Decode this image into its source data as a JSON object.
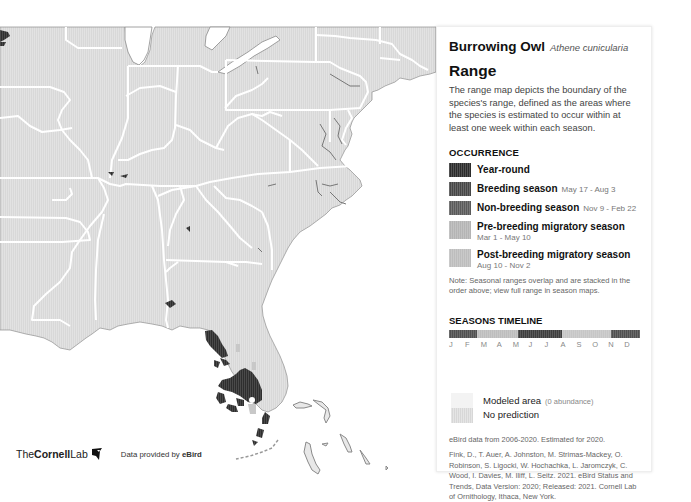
{
  "species": {
    "common_name": "Burrowing Owl",
    "scientific_name": "Athene cunicularia"
  },
  "panel": {
    "heading": "Range",
    "description": "The range map depicts the boundary of the species's range, defined as the areas where the species is estimated to occur within at least one week within each season.",
    "occurrence_heading": "OCCURRENCE",
    "legend": [
      {
        "label": "Year-round",
        "dates": "",
        "color": "#2b2b2b"
      },
      {
        "label": "Breeding season",
        "dates": "May 17 - Aug 3",
        "color": "#474747"
      },
      {
        "label": "Non-breeding season",
        "dates": "Nov 9 - Feb 22",
        "color": "#5a5a5a"
      },
      {
        "label": "Pre-breeding migratory season",
        "dates": "Mar 1 - May 10",
        "color": "#b4b4b4"
      },
      {
        "label": "Post-breeding migratory season",
        "dates": "Aug 10 - Nov 2",
        "color": "#bdbdbd"
      }
    ],
    "note": "Note: Seasonal ranges overlap and are stacked in the order above; view full range in season maps.",
    "timeline_heading": "SEASONS TIMELINE",
    "timeline_months": [
      "J",
      "F",
      "M",
      "A",
      "M",
      "J",
      "J",
      "A",
      "S",
      "O",
      "N",
      "D"
    ],
    "timeline_segments": [
      {
        "season": "non-breeding",
        "start_month": 0,
        "end_month": 1.75,
        "color": "#505050"
      },
      {
        "season": "pre-breeding",
        "start_month": 1.75,
        "end_month": 4.35,
        "color": "#bdbdbd"
      },
      {
        "season": "breeding",
        "start_month": 4.35,
        "end_month": 7.1,
        "color": "#3e3e3e"
      },
      {
        "season": "post-breeding",
        "start_month": 7.1,
        "end_month": 10.2,
        "color": "#c6c6c6"
      },
      {
        "season": "non-breeding",
        "start_month": 10.2,
        "end_month": 12,
        "color": "#505050"
      }
    ],
    "modeled_area_label": "Modeled area",
    "modeled_area_note": "(0 abundance)",
    "no_prediction_label": "No prediction",
    "data_source": "eBird data from 2006-2020. Estimated for 2020.",
    "citation": "Fink, D., T. Auer, A. Johnston, M. Strimas-Mackey, O. Robinson, S. Ligocki, W. Hochachka, L. Jaromczyk, C. Wood, I. Davies, M. Iliff, L. Seitz. 2021. eBird Status and Trends, Data Version: 2020; Released: 2021. Cornell Lab of Ornithology, Ithaca, New York. https://doi.org/10.2173/ebirdst.2020"
  },
  "footer": {
    "logo_prefix": "The",
    "logo_bold": "Cornell",
    "logo_suffix": "Lab",
    "provided_prefix": "Data provided by ",
    "provided_brand": "eBird"
  },
  "map": {
    "land_color": "#d9d9d9",
    "water_color": "#ffffff",
    "border_color": "#ffffff",
    "region": "Eastern United States"
  }
}
